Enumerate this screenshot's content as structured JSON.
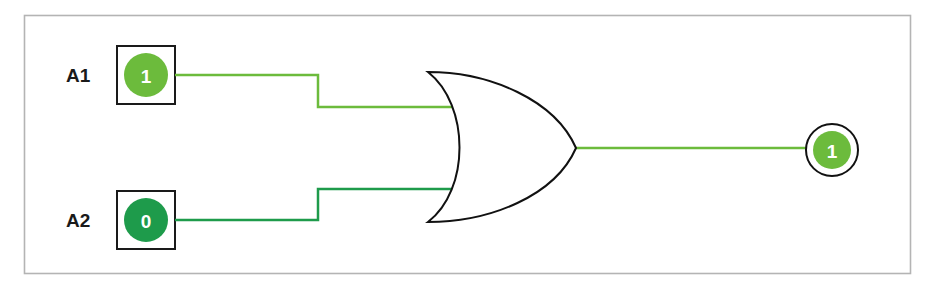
{
  "diagram": {
    "type": "logic-circuit",
    "gate": {
      "type": "OR",
      "name": "OR gate"
    },
    "inputs": [
      {
        "label": "A1",
        "value": "1",
        "state": "high",
        "color": "#6cbb3c"
      },
      {
        "label": "A2",
        "value": "0",
        "state": "low",
        "color": "#1e9b4b"
      }
    ],
    "output": {
      "value": "1",
      "state": "high",
      "color": "#6cbb3c"
    },
    "colors": {
      "high_signal": "#6cbb3c",
      "low_signal": "#1e9b4b",
      "outline": "#111111",
      "frame": "#b4b4b4"
    }
  }
}
